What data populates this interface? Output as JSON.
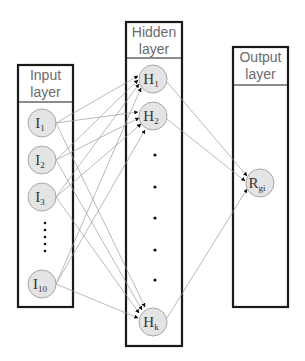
{
  "diagram": {
    "type": "neural-network-architecture",
    "layers": [
      {
        "id": "input",
        "title_line1": "Input",
        "title_line2": "layer",
        "nodes": [
          {
            "id": "I1",
            "base": "I",
            "sub": "1"
          },
          {
            "id": "I2",
            "base": "I",
            "sub": "2"
          },
          {
            "id": "I3",
            "base": "I",
            "sub": "3"
          },
          {
            "id": "I10",
            "base": "I",
            "sub": "10"
          }
        ],
        "ellipsis": "vertical dots between I3 and I10"
      },
      {
        "id": "hidden",
        "title_line1": "Hidden",
        "title_line2": "layer",
        "nodes": [
          {
            "id": "H1",
            "base": "H",
            "sub": "1"
          },
          {
            "id": "H2",
            "base": "H",
            "sub": "2"
          },
          {
            "id": "Hk",
            "base": "H",
            "sub": "k"
          }
        ],
        "ellipsis": "vertical dots between H2 and Hk"
      },
      {
        "id": "output",
        "title_line1": "Output",
        "title_line2": "layer",
        "nodes": [
          {
            "id": "Rgi",
            "base": "R",
            "sub": "gi"
          }
        ]
      }
    ],
    "connections": "fully connected: every input node to H1, H2, Hk; every hidden node to Rgi (arrows)",
    "colors": {
      "node_fill": "#e4e4e4",
      "node_stroke": "#a8a8a8",
      "edge": "#9c9c9c",
      "box_border": "#1a1a1a",
      "header_text": "#6b6b6b"
    }
  }
}
